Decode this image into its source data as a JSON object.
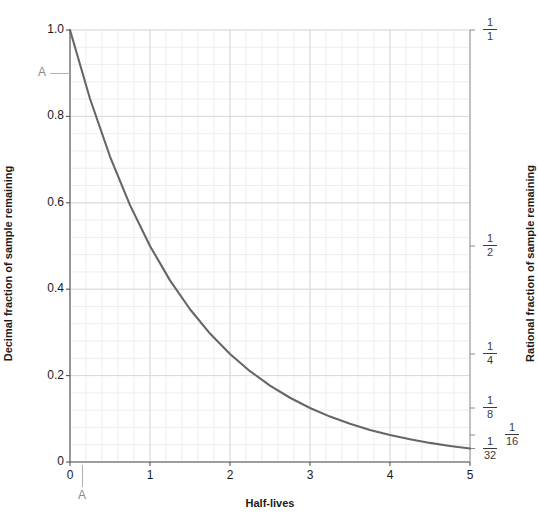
{
  "chart_data": {
    "type": "line",
    "title": "",
    "xlabel": "Half-lives",
    "ylabel": "Decimal fraction of sample remaining",
    "ylabel_right": "Rational fraction of sample remaining",
    "xlim": [
      0,
      5
    ],
    "ylim": [
      0,
      1
    ],
    "grid": true,
    "legend": "none",
    "series": [
      {
        "name": "radioactive decay",
        "color": "#666666",
        "x": [
          0,
          0.25,
          0.5,
          0.75,
          1,
          1.25,
          1.5,
          1.75,
          2,
          2.25,
          2.5,
          2.75,
          3,
          3.25,
          3.5,
          3.75,
          4,
          4.25,
          4.5,
          4.75,
          5
        ],
        "y": [
          1.0,
          0.8409,
          0.7071,
          0.5946,
          0.5,
          0.4204,
          0.3536,
          0.2973,
          0.25,
          0.2102,
          0.1768,
          0.1487,
          0.125,
          0.1051,
          0.0884,
          0.0743,
          0.0625,
          0.0526,
          0.0442,
          0.0372,
          0.03125
        ]
      }
    ],
    "x_ticks": [
      "0",
      "1",
      "2",
      "3",
      "4",
      "5"
    ],
    "x_tick_values": [
      0,
      1,
      2,
      3,
      4,
      5
    ],
    "y_ticks_left": [
      "0",
      "0.2",
      "0.4",
      "0.6",
      "0.8",
      "1.0"
    ],
    "y_tick_values_left": [
      0,
      0.2,
      0.4,
      0.6,
      0.8,
      1.0
    ],
    "y_ticks_right": [
      {
        "numerator": "1",
        "denominator": "1",
        "value": 1.0,
        "offset": 0
      },
      {
        "numerator": "1",
        "denominator": "2",
        "value": 0.5,
        "offset": 0
      },
      {
        "numerator": "1",
        "denominator": "4",
        "value": 0.25,
        "offset": 0
      },
      {
        "numerator": "1",
        "denominator": "8",
        "value": 0.125,
        "offset": 0
      },
      {
        "numerator": "1",
        "denominator": "16",
        "value": 0.0625,
        "offset": 22
      },
      {
        "numerator": "1",
        "denominator": "32",
        "value": 0.03125,
        "offset": 0
      }
    ],
    "annotations": [
      {
        "label": "A",
        "axis": "y",
        "value": 0.9
      },
      {
        "label": "A",
        "axis": "x",
        "value": 0.15
      }
    ]
  }
}
